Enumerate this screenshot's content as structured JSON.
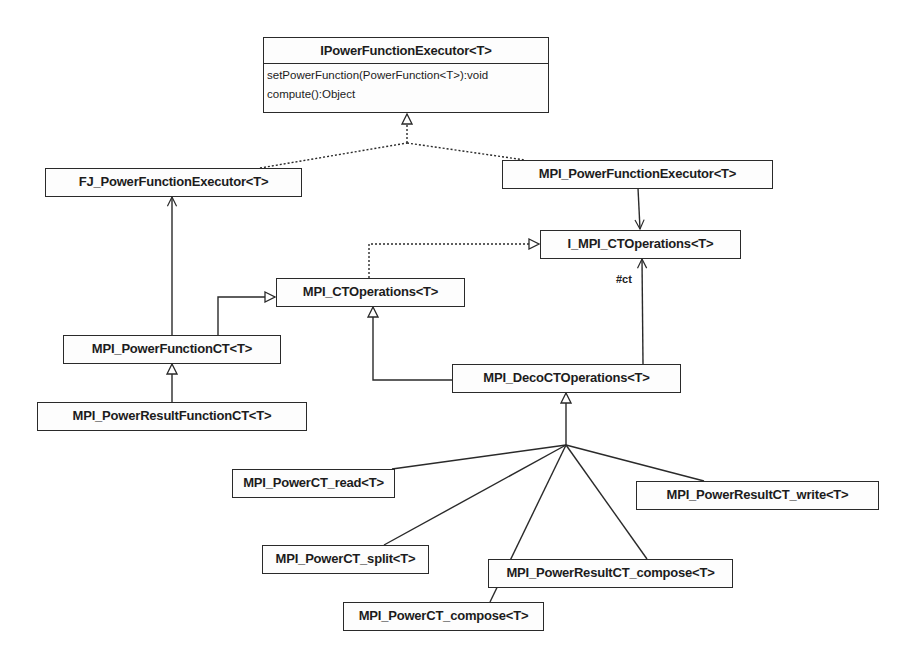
{
  "diagram": {
    "type": "UML class diagram",
    "classes": {
      "ipowerfunctionexecutor": {
        "name": "IPowerFunctionExecutor<T>",
        "methods": [
          "setPowerFunction(PowerFunction<T>):void",
          "compute():Object"
        ]
      },
      "fj_powerfunctionexecutor": {
        "name": "FJ_PowerFunctionExecutor<T>"
      },
      "mpi_powerfunctionexecutor": {
        "name": "MPI_PowerFunctionExecutor<T>"
      },
      "i_mpi_ctoperations": {
        "name": "I_MPI_CTOperations<T>"
      },
      "mpi_ctoperations": {
        "name": "MPI_CTOperations<T>"
      },
      "mpi_powerfunctionct": {
        "name": "MPI_PowerFunctionCT<T>"
      },
      "mpi_powerresultfunctionct": {
        "name": "MPI_PowerResultFunctionCT<T>"
      },
      "mpi_decoctoperations": {
        "name": "MPI_DecoCTOperations<T>"
      },
      "mpi_powerct_read": {
        "name": "MPI_PowerCT_read<T>"
      },
      "mpi_powerresultct_write": {
        "name": "MPI_PowerResultCT_write<T>"
      },
      "mpi_powerct_split": {
        "name": "MPI_PowerCT_split<T>"
      },
      "mpi_powerresultct_compose": {
        "name": "MPI_PowerResultCT_compose<T>"
      },
      "mpi_powerct_compose": {
        "name": "MPI_PowerCT_compose<T>"
      }
    },
    "relations": [
      {
        "from": "FJ_PowerFunctionExecutor<T>",
        "to": "IPowerFunctionExecutor<T>",
        "kind": "realization"
      },
      {
        "from": "MPI_PowerFunctionExecutor<T>",
        "to": "IPowerFunctionExecutor<T>",
        "kind": "realization"
      },
      {
        "from": "MPI_PowerFunctionExecutor<T>",
        "to": "I_MPI_CTOperations<T>",
        "kind": "association"
      },
      {
        "from": "MPI_CTOperations<T>",
        "to": "I_MPI_CTOperations<T>",
        "kind": "realization"
      },
      {
        "from": "MPI_PowerFunctionCT<T>",
        "to": "FJ_PowerFunctionExecutor<T>",
        "kind": "association"
      },
      {
        "from": "MPI_PowerFunctionCT<T>",
        "to": "MPI_CTOperations<T>",
        "kind": "generalization"
      },
      {
        "from": "MPI_PowerResultFunctionCT<T>",
        "to": "MPI_PowerFunctionCT<T>",
        "kind": "generalization"
      },
      {
        "from": "MPI_DecoCTOperations<T>",
        "to": "MPI_CTOperations<T>",
        "kind": "generalization"
      },
      {
        "from": "MPI_DecoCTOperations<T>",
        "to": "I_MPI_CTOperations<T>",
        "kind": "association",
        "label": "#ct"
      },
      {
        "from": "MPI_PowerCT_read<T>",
        "to": "MPI_DecoCTOperations<T>",
        "kind": "generalization"
      },
      {
        "from": "MPI_PowerResultCT_write<T>",
        "to": "MPI_DecoCTOperations<T>",
        "kind": "generalization"
      },
      {
        "from": "MPI_PowerCT_split<T>",
        "to": "MPI_DecoCTOperations<T>",
        "kind": "generalization"
      },
      {
        "from": "MPI_PowerResultCT_compose<T>",
        "to": "MPI_DecoCTOperations<T>",
        "kind": "generalization"
      },
      {
        "from": "MPI_PowerCT_compose<T>",
        "to": "MPI_DecoCTOperations<T>",
        "kind": "generalization"
      }
    ],
    "labels": {
      "ct": "#ct"
    },
    "colors": {
      "line": "#2a2a2a",
      "background": "#ffffff"
    }
  }
}
